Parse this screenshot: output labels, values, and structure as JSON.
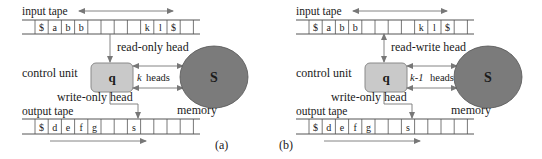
{
  "panels": [
    {
      "id": "a",
      "offset_x": 0,
      "caption": "(a)",
      "input_tape_label": "input tape",
      "input_tape_cells": [
        "$",
        "a",
        "b",
        "b",
        "",
        "",
        "",
        "",
        "k",
        "l",
        "$",
        ""
      ],
      "input_head_label": "read-only head",
      "input_head_bidirectional": false,
      "control_unit_label": "control unit",
      "state_label": "q",
      "heads_count_label": "k",
      "heads_label": "heads",
      "memory_symbol": "S",
      "memory_label": "memory",
      "output_head_label": "write-only head",
      "output_tape_label": "output tape",
      "output_tape_cells": [
        "$",
        "d",
        "e",
        "f",
        "g",
        "",
        "",
        "s",
        "",
        "",
        "",
        ""
      ]
    },
    {
      "id": "b",
      "offset_x": 274,
      "caption": "(b)",
      "input_tape_label": "input tape",
      "input_tape_cells": [
        "$",
        "a",
        "b",
        "b",
        "",
        "",
        "",
        "",
        "k",
        "l",
        "$",
        ""
      ],
      "input_head_label": "read-write head",
      "input_head_bidirectional": true,
      "control_unit_label": "control unit",
      "state_label": "q",
      "heads_count_label": "k-1",
      "heads_label": "heads",
      "memory_symbol": "S",
      "memory_label": "memory",
      "output_head_label": "write-only head",
      "output_tape_label": "output tape",
      "output_tape_cells": [
        "$",
        "d",
        "e",
        "f",
        "g",
        "",
        "",
        "s",
        "",
        "",
        "",
        ""
      ]
    }
  ],
  "colors": {
    "line": "#555555",
    "state_fill": "#c9c9c9",
    "state_stroke": "#8a8a8a",
    "memory_fill": "#7b7b7b",
    "memory_stroke": "#555555",
    "arrow": "#777777"
  }
}
